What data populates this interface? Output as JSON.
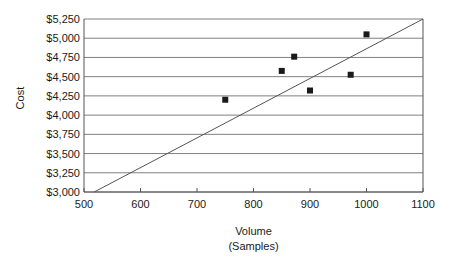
{
  "chart_data": {
    "type": "scatter",
    "title": "",
    "xlabel": "Volume (Samples)",
    "xlabel_lines": [
      "Volume",
      "(Samples)"
    ],
    "ylabel": "Cost",
    "xlim": [
      500,
      1100
    ],
    "ylim": [
      3000,
      5250
    ],
    "x_ticks": [
      500,
      600,
      700,
      800,
      900,
      1000,
      1100
    ],
    "x_tick_labels": [
      "500",
      "600",
      "700",
      "800",
      "900",
      "1000",
      "1100"
    ],
    "y_ticks": [
      3000,
      3250,
      3500,
      3750,
      4000,
      4250,
      4500,
      4750,
      5000,
      5250
    ],
    "y_tick_labels": [
      "$3,000",
      "$3,250",
      "$3,500",
      "$3,750",
      "$4,000",
      "$4,250",
      "$4,500",
      "$4,750",
      "$5,000",
      "$5,250"
    ],
    "grid": "horizontal",
    "legend": "none",
    "marker": "filled-square",
    "marker_color": "#1a1a1a",
    "line_color": "#555555",
    "axis_color": "#555555",
    "grid_color": "#808080",
    "points": [
      {
        "x": 750,
        "y": 4200
      },
      {
        "x": 850,
        "y": 4575
      },
      {
        "x": 872,
        "y": 4760
      },
      {
        "x": 900,
        "y": 4320
      },
      {
        "x": 972,
        "y": 4525
      },
      {
        "x": 1000,
        "y": 5050
      }
    ],
    "series": [
      {
        "name": "Observations",
        "x": [
          750,
          850,
          872,
          900,
          972,
          1000
        ],
        "values": [
          4200,
          4575,
          4760,
          4320,
          4525,
          5050
        ]
      },
      {
        "name": "Trend line",
        "type": "line",
        "x": [
          518,
          1100
        ],
        "values": [
          3000,
          5250
        ]
      }
    ]
  }
}
